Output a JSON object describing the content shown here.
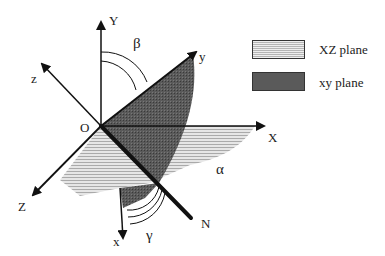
{
  "diagram": {
    "axes": {
      "Y": "Y",
      "X": "X",
      "Z": "Z",
      "x": "x",
      "y": "y",
      "z": "z",
      "N": "N",
      "origin": "O"
    },
    "angles": {
      "alpha": "α",
      "beta": "β",
      "gamma": "γ"
    },
    "legend": [
      {
        "label": "XZ plane",
        "fill": "#d9d9d9",
        "pattern": "light-horizontal-hatch"
      },
      {
        "label": "xy plane",
        "fill": "#555555",
        "pattern": "dark-stipple"
      }
    ]
  }
}
